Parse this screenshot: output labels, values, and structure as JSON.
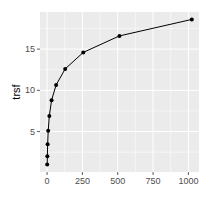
{
  "chart_data": {
    "type": "line",
    "title": "",
    "xlabel": "",
    "ylabel": "trsf",
    "x": [
      1,
      2,
      4,
      8,
      16,
      32,
      64,
      128,
      256,
      512,
      1024
    ],
    "series": [
      {
        "name": "trsf",
        "values": [
          1.0,
          2.0,
          3.45,
          5.1,
          6.9,
          8.8,
          10.65,
          12.6,
          14.6,
          16.6,
          18.6
        ]
      }
    ],
    "xticks": [
      0,
      250,
      500,
      750,
      1000
    ],
    "xtick_labels": [
      "0",
      "250",
      "500",
      "750",
      "1000"
    ],
    "yticks": [
      5,
      10,
      15
    ],
    "ytick_labels": [
      "5",
      "10",
      "15"
    ],
    "xlim": [
      -50,
      1075
    ],
    "ylim": [
      0.1,
      19.5
    ],
    "grid": true,
    "legend": "none",
    "colors": {
      "panel": "#ebebeb",
      "grid": "#ffffff",
      "line": "#000000",
      "text": "#4d4d4d",
      "axis_title": "#000000"
    }
  }
}
